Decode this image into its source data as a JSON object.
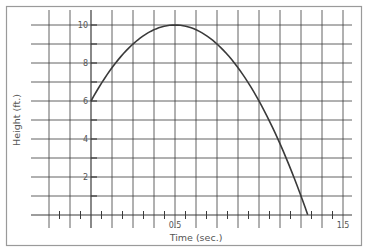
{
  "chart_data": {
    "type": "line",
    "title": "",
    "xlabel": "Time (sec.)",
    "ylabel": "Height (ft.)",
    "xlim": [
      -0.375,
      1.5
    ],
    "ylim": [
      0,
      10
    ],
    "grid": true,
    "legend": null,
    "x_tick_labels": [
      {
        "value": 0.5,
        "label": "0.5"
      },
      {
        "value": 1.5,
        "label": "1.5"
      }
    ],
    "y_tick_labels": [
      {
        "value": 2,
        "label": "2"
      },
      {
        "value": 4,
        "label": "4"
      },
      {
        "value": 6,
        "label": "6"
      },
      {
        "value": 8,
        "label": "8"
      },
      {
        "value": 10,
        "label": "10"
      }
    ],
    "x_gridline_step": 0.125,
    "y_gridline_step": 1,
    "series": [
      {
        "name": "height",
        "equation": "h = 6 + 16t - 16t^2",
        "x": [
          0,
          0.125,
          0.25,
          0.375,
          0.5,
          0.625,
          0.75,
          0.875,
          1.0,
          1.125,
          1.25,
          1.29
        ],
        "y": [
          6,
          7.75,
          9,
          9.75,
          10,
          9.75,
          9,
          7.75,
          6,
          3.75,
          1,
          0
        ]
      }
    ]
  },
  "colors": {
    "grid": "#3a3a3a",
    "curve": "#3a3a3a",
    "frame": "#9a9a9a",
    "text": "#555555"
  }
}
